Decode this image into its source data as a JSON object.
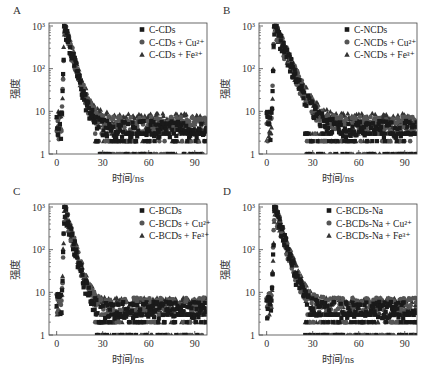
{
  "figure": {
    "ylabel": "强度",
    "xlabel": "时间/ns",
    "xticks": [
      0,
      30,
      60,
      90
    ],
    "yticks": [
      {
        "value": 1,
        "label": "1"
      },
      {
        "value": 10,
        "label": "10"
      },
      {
        "value": 100,
        "label": "10²"
      },
      {
        "value": 1000,
        "label": "10³"
      }
    ]
  },
  "chart_data": [
    {
      "panel": "A",
      "type": "scatter",
      "title": "",
      "xlabel": "时间/ns",
      "ylabel": "强度",
      "xlim": [
        -5,
        98
      ],
      "ylim": [
        1,
        1000
      ],
      "yscale": "log",
      "legend_position": "upper right",
      "grid": false,
      "series": [
        {
          "name": "C-CDs",
          "marker": "square",
          "peak_x": 5,
          "peak_y": 1000,
          "tau": 3.2,
          "floor": 4
        },
        {
          "name": "C-CDs + Cu²⁺",
          "marker": "circle",
          "peak_x": 5,
          "peak_y": 950,
          "tau": 3.4,
          "floor": 5
        },
        {
          "name": "C-CDs + Fe³⁺",
          "marker": "triangle",
          "peak_x": 5,
          "peak_y": 900,
          "tau": 3.6,
          "floor": 6
        }
      ]
    },
    {
      "panel": "B",
      "type": "scatter",
      "title": "",
      "xlabel": "时间/ns",
      "ylabel": "强度",
      "xlim": [
        -5,
        98
      ],
      "ylim": [
        1,
        1000
      ],
      "yscale": "log",
      "legend_position": "upper right",
      "grid": false,
      "series": [
        {
          "name": "C-NCDs",
          "marker": "square",
          "peak_x": 5,
          "peak_y": 1000,
          "tau": 5.0,
          "floor": 4
        },
        {
          "name": "C-NCDs + Cu²⁺",
          "marker": "circle",
          "peak_x": 5,
          "peak_y": 950,
          "tau": 5.2,
          "floor": 5
        },
        {
          "name": "C-NCDs + Fe³⁺",
          "marker": "triangle",
          "peak_x": 5,
          "peak_y": 900,
          "tau": 5.4,
          "floor": 6
        }
      ]
    },
    {
      "panel": "C",
      "type": "scatter",
      "title": "",
      "xlabel": "时间/ns",
      "ylabel": "强度",
      "xlim": [
        -5,
        98
      ],
      "ylim": [
        1,
        1000
      ],
      "yscale": "log",
      "legend_position": "upper right",
      "grid": false,
      "series": [
        {
          "name": "C-BCDs",
          "marker": "square",
          "peak_x": 5,
          "peak_y": 1000,
          "tau": 3.0,
          "floor": 4
        },
        {
          "name": "C-BCDs + Cu²⁺",
          "marker": "circle",
          "peak_x": 5,
          "peak_y": 950,
          "tau": 3.2,
          "floor": 5
        },
        {
          "name": "C-BCDs + Fe³⁺",
          "marker": "triangle",
          "peak_x": 5,
          "peak_y": 900,
          "tau": 3.4,
          "floor": 5
        }
      ]
    },
    {
      "panel": "D",
      "type": "scatter",
      "title": "",
      "xlabel": "时间/ns",
      "ylabel": "强度",
      "xlim": [
        -5,
        98
      ],
      "ylim": [
        1,
        1000
      ],
      "yscale": "log",
      "legend_position": "upper right",
      "grid": false,
      "series": [
        {
          "name": "C-BCDs-Na",
          "marker": "square",
          "peak_x": 5,
          "peak_y": 1000,
          "tau": 3.6,
          "floor": 4
        },
        {
          "name": "C-BCDs-Na + Cu²⁺",
          "marker": "circle",
          "peak_x": 5,
          "peak_y": 950,
          "tau": 3.8,
          "floor": 5
        },
        {
          "name": "C-BCDs-Na + Fe³⁺",
          "marker": "triangle",
          "peak_x": 5,
          "peak_y": 900,
          "tau": 4.0,
          "floor": 5
        }
      ]
    }
  ],
  "layout": {
    "panels": [
      {
        "letter": "A",
        "x": 0,
        "y": 0
      },
      {
        "letter": "B",
        "x": 210,
        "y": 0
      },
      {
        "letter": "C",
        "x": 0,
        "y": 181
      },
      {
        "letter": "D",
        "x": 210,
        "y": 181
      }
    ]
  },
  "colors": {
    "square": "#1a1a1a",
    "circle": "#555555",
    "triangle": "#333333",
    "axis": "#444444"
  }
}
